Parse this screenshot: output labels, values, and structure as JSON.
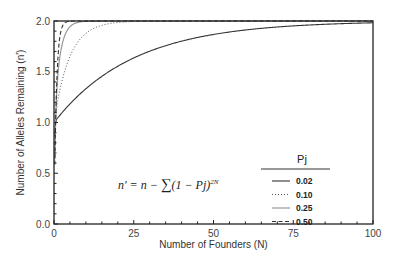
{
  "chart_data": {
    "type": "line",
    "title": "",
    "xlabel": "Number of Founders (N)",
    "ylabel": "Number of Alleles Remaining (n')",
    "xlim": [
      0,
      100
    ],
    "ylim": [
      0,
      2.0
    ],
    "xticks": [
      "0",
      "25",
      "50",
      "75",
      "100"
    ],
    "yticks": [
      "0.0",
      "0.5",
      "1.0",
      "1.5",
      "2.0"
    ],
    "grid": false,
    "legend": {
      "title": "Pj",
      "position": "right-middle",
      "entries": [
        "0.02",
        "0.10",
        "0.25",
        "0.50"
      ]
    },
    "annotation": "n' = n − Σ(1 − Pj)^2N",
    "x": [
      1,
      2,
      3,
      5,
      10,
      15,
      20,
      25,
      30,
      40,
      50,
      60,
      75,
      100
    ],
    "series": [
      {
        "name": "0.02",
        "style": "solid-dark",
        "values": [
          0.04,
          0.08,
          0.11,
          0.18,
          0.33,
          0.45,
          0.55,
          0.64,
          0.7,
          0.8,
          0.87,
          0.91,
          0.95,
          0.98
        ]
      },
      {
        "name": "0.10",
        "style": "dotted",
        "values": [
          0.2,
          0.36,
          0.47,
          0.65,
          0.88,
          0.96,
          0.99,
          1.0,
          1.0,
          1.0,
          1.0,
          1.0,
          1.0,
          1.0
        ]
      },
      {
        "name": "0.25",
        "style": "solid-gray",
        "values": [
          0.5,
          0.75,
          0.88,
          0.97,
          1.0,
          1.0,
          1.0,
          1.0,
          1.0,
          1.0,
          1.0,
          1.0,
          1.0,
          1.0
        ]
      },
      {
        "name": "0.50",
        "style": "dashed",
        "values": [
          0.75,
          0.94,
          0.98,
          1.0,
          1.0,
          1.0,
          1.0,
          1.0,
          1.0,
          1.0,
          1.0,
          1.0,
          1.0,
          1.0
        ]
      }
    ],
    "series_note": "values are fraction of max (2.0); n' = 2 − (1−p)^(2N) − p^(2N)",
    "n_alleles": 2,
    "p_values": [
      0.02,
      0.1,
      0.25,
      0.5
    ]
  },
  "formula": {
    "lhs": "n' = n − ",
    "sum": "∑",
    "body": "(1 − Pj)",
    "exp": "2N"
  }
}
